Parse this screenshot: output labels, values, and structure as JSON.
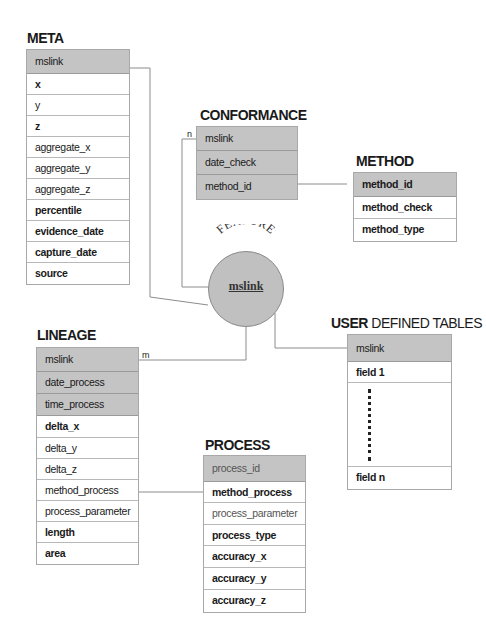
{
  "diagram": {
    "tables": {
      "meta": {
        "title": "META",
        "rows": [
          "mslink",
          "x",
          "y",
          "z",
          "aggregate_x",
          "aggregate_y",
          "aggregate_z",
          "percentile",
          "evidence_date",
          "capture_date",
          "source"
        ]
      },
      "conformance": {
        "title": "CONFORMANCE",
        "rows": [
          "mslink",
          "date_check",
          "method_id"
        ]
      },
      "method": {
        "title": "METHOD",
        "rows": [
          "method_id",
          "method_check",
          "method_type"
        ]
      },
      "lineage": {
        "title": "LINEAGE",
        "rows": [
          "mslink",
          "date_process",
          "time_process",
          "delta_x",
          "delta_y",
          "delta_z",
          "method_process",
          "process_parameter",
          "length",
          "area"
        ]
      },
      "process": {
        "title": "PROCESS",
        "rows": [
          "process_id",
          "method_process",
          "process_parameter",
          "process_type",
          "accuracy_x",
          "accuracy_y",
          "accuracy_z"
        ]
      },
      "user_defined": {
        "title_bold": "USER",
        "title_rest": " DEFINED TABLES",
        "rows": [
          "mslink",
          "field 1",
          "field n"
        ]
      }
    },
    "feature": {
      "title": "FEATURE",
      "key": "mslink"
    },
    "cardinality": {
      "conformance": "n",
      "lineage": "m"
    },
    "colors": {
      "key_fill": "#c4c4c4",
      "circle_fill": "#c0c0c0",
      "line": "#8c8c8c"
    }
  }
}
